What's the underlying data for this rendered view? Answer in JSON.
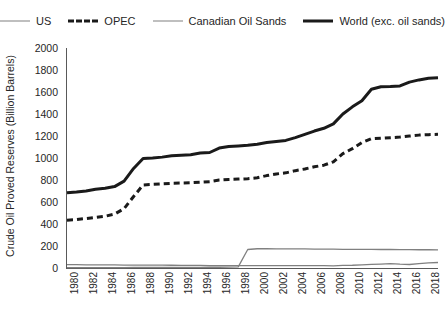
{
  "legend": {
    "position": "top-center",
    "entries": [
      {
        "label": "US",
        "style": "thin-solid",
        "color": "#808080"
      },
      {
        "label": "OPEC",
        "style": "thick-dashed",
        "color": "#1a1a1a"
      },
      {
        "label": "Canadian Oil Sands",
        "style": "thin-solid",
        "color": "#808080"
      },
      {
        "label": "World (exc. oil sands)",
        "style": "thick-solid",
        "color": "#1a1a1a"
      }
    ]
  },
  "axes": {
    "y_title": "Crude Oil Proved Reserves (Billion Barrels)",
    "y_ticks": [
      0,
      200,
      400,
      600,
      800,
      1000,
      1200,
      1400,
      1600,
      1800,
      2000
    ],
    "x_ticks": [
      "1980",
      "1982",
      "1984",
      "1986",
      "1988",
      "1990",
      "1992",
      "1994",
      "1996",
      "1998",
      "2000",
      "2002",
      "2004",
      "2006",
      "2008",
      "2010",
      "2012",
      "2014",
      "2016",
      "2018"
    ]
  },
  "chart_data": {
    "type": "line",
    "title": "",
    "subtitle": "",
    "xlabel": "",
    "ylabel": "Crude Oil Proved Reserves (Billion Barrels)",
    "xlim": [
      1980,
      2019
    ],
    "ylim": [
      0,
      2000
    ],
    "grid": false,
    "legend_position": "top",
    "x": [
      1980,
      1981,
      1982,
      1983,
      1984,
      1985,
      1986,
      1987,
      1988,
      1989,
      1990,
      1991,
      1992,
      1993,
      1994,
      1995,
      1996,
      1997,
      1998,
      1999,
      2000,
      2001,
      2002,
      2003,
      2004,
      2005,
      2006,
      2007,
      2008,
      2009,
      2010,
      2011,
      2012,
      2013,
      2014,
      2015,
      2016,
      2017,
      2018,
      2019
    ],
    "series": [
      {
        "name": "World (exc. oil sands)",
        "style": "thick-solid",
        "color": "#1a1a1a",
        "values": [
          683,
          690,
          700,
          715,
          725,
          740,
          790,
          905,
          995,
          1000,
          1008,
          1020,
          1025,
          1030,
          1045,
          1050,
          1090,
          1105,
          1110,
          1115,
          1125,
          1140,
          1150,
          1160,
          1185,
          1215,
          1245,
          1270,
          1310,
          1400,
          1465,
          1520,
          1625,
          1648,
          1650,
          1655,
          1690,
          1710,
          1725,
          1730
        ]
      },
      {
        "name": "OPEC",
        "style": "thick-dashed",
        "color": "#1a1a1a",
        "values": [
          435,
          440,
          450,
          460,
          470,
          490,
          540,
          650,
          755,
          760,
          765,
          770,
          772,
          775,
          780,
          785,
          800,
          805,
          808,
          812,
          820,
          840,
          855,
          865,
          885,
          900,
          920,
          935,
          965,
          1040,
          1085,
          1140,
          1175,
          1180,
          1185,
          1190,
          1200,
          1208,
          1212,
          1215
        ]
      },
      {
        "name": "Canadian Oil Sands",
        "style": "thin-solid",
        "color": "#808080",
        "values": [
          3,
          3,
          3,
          3,
          4,
          4,
          4,
          5,
          5,
          5,
          5,
          6,
          6,
          6,
          6,
          7,
          7,
          8,
          10,
          168,
          175,
          175,
          174,
          174,
          173,
          173,
          172,
          171,
          171,
          170,
          170,
          169,
          169,
          168,
          168,
          167,
          167,
          166,
          166,
          165
        ]
      },
      {
        "name": "US",
        "style": "thin-solid",
        "color": "#808080",
        "values": [
          30,
          30,
          29,
          28,
          28,
          28,
          27,
          27,
          27,
          26,
          26,
          25,
          24,
          23,
          23,
          22,
          22,
          22,
          21,
          22,
          22,
          22,
          22,
          22,
          22,
          22,
          21,
          21,
          19,
          23,
          25,
          29,
          33,
          36,
          40,
          35,
          32,
          40,
          47,
          50
        ]
      }
    ]
  }
}
